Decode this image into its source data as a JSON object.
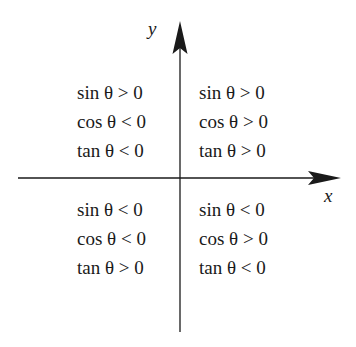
{
  "axes": {
    "x_label": "x",
    "y_label": "y",
    "color": "#1a1a1a"
  },
  "quadrants": {
    "II": {
      "position": "top-left",
      "lines": [
        "sin θ > 0",
        "cos θ < 0",
        "tan θ < 0"
      ]
    },
    "I": {
      "position": "top-right",
      "lines": [
        "sin θ > 0",
        "cos θ > 0",
        "tan θ > 0"
      ]
    },
    "III": {
      "position": "bottom-left",
      "lines": [
        "sin θ < 0",
        "cos θ < 0",
        "tan θ > 0"
      ]
    },
    "IV": {
      "position": "bottom-right",
      "lines": [
        "sin θ < 0",
        "cos θ > 0",
        "tan θ < 0"
      ]
    }
  }
}
